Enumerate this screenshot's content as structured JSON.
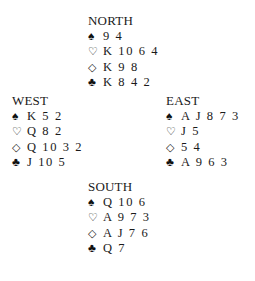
{
  "diagram": {
    "type": "bridge-deal",
    "symbols": {
      "spade": "♠",
      "heart": "♡",
      "diamond": "◇",
      "club": "♣"
    },
    "hands": {
      "north": {
        "label": "NORTH",
        "spades": "9 4",
        "hearts": "K 10 6 4",
        "diamonds": "K 9 8",
        "clubs": "K 8 4 2"
      },
      "west": {
        "label": "WEST",
        "spades": "K 5 2",
        "hearts": "Q 8 2",
        "diamonds": "Q 10 3 2",
        "clubs": "J 10 5"
      },
      "east": {
        "label": "EAST",
        "spades": "A J 8 7 3",
        "hearts": "J 5",
        "diamonds": "5 4",
        "clubs": "A 9 6 3"
      },
      "south": {
        "label": "SOUTH",
        "spades": "Q 10 6",
        "hearts": "A 9 7 3",
        "diamonds": "A J 7 6",
        "clubs": "Q 7"
      }
    }
  }
}
